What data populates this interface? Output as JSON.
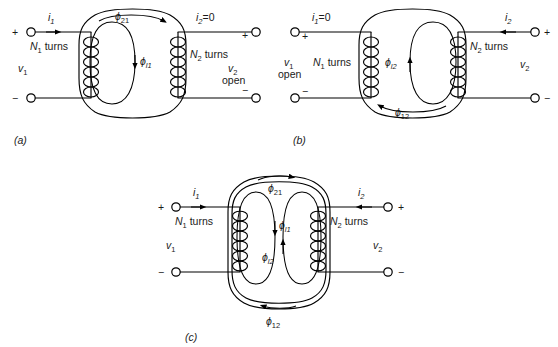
{
  "figure": {
    "type": "transformer-flux-diagram",
    "panels": [
      {
        "id": "a",
        "caption": "(a)",
        "left_terminal_top_sign": "+",
        "left_terminal_bottom_sign": "−",
        "right_terminal_top_sign": "+",
        "right_terminal_bottom_sign": "−",
        "current_left": {
          "symbol": "i",
          "subscript": "1",
          "value": "",
          "text": "i"
        },
        "current_right": {
          "symbol": "i",
          "subscript": "2",
          "value": "=0",
          "text": "i"
        },
        "voltage_left": {
          "symbol": "v",
          "subscript": "1",
          "note": ""
        },
        "voltage_right": {
          "symbol": "v",
          "subscript": "2",
          "note": "open"
        },
        "turns_left": {
          "symbol": "N",
          "subscript": "1",
          "word": "turns"
        },
        "turns_right": {
          "symbol": "N",
          "subscript": "2",
          "word": "turns"
        },
        "flux_mutual": {
          "symbol": "ϕ",
          "subscript": "21"
        },
        "flux_leakage": {
          "symbol": "ϕ",
          "subscript": "l1"
        }
      },
      {
        "id": "b",
        "caption": "(b)",
        "left_terminal_top_sign": "+",
        "left_terminal_bottom_sign": "−",
        "right_terminal_top_sign": "+",
        "right_terminal_bottom_sign": "−",
        "current_left": {
          "symbol": "i",
          "subscript": "1",
          "value": "=0",
          "text": "i"
        },
        "current_right": {
          "symbol": "i",
          "subscript": "2",
          "value": "",
          "text": "i"
        },
        "voltage_left": {
          "symbol": "v",
          "subscript": "1",
          "note": "open"
        },
        "voltage_right": {
          "symbol": "v",
          "subscript": "2",
          "note": ""
        },
        "turns_left": {
          "symbol": "N",
          "subscript": "1",
          "word": "turns"
        },
        "turns_right": {
          "symbol": "N",
          "subscript": "2",
          "word": "turns"
        },
        "flux_mutual": {
          "symbol": "ϕ",
          "subscript": "12"
        },
        "flux_leakage": {
          "symbol": "ϕ",
          "subscript": "l2"
        }
      },
      {
        "id": "c",
        "caption": "(c)",
        "left_terminal_top_sign": "+",
        "left_terminal_bottom_sign": "−",
        "right_terminal_top_sign": "+",
        "right_terminal_bottom_sign": "−",
        "current_left": {
          "symbol": "i",
          "subscript": "1",
          "value": "",
          "text": "i"
        },
        "current_right": {
          "symbol": "i",
          "subscript": "2",
          "value": "",
          "text": "i"
        },
        "voltage_left": {
          "symbol": "v",
          "subscript": "1",
          "note": ""
        },
        "voltage_right": {
          "symbol": "v",
          "subscript": "2",
          "note": ""
        },
        "turns_left": {
          "symbol": "N",
          "subscript": "1",
          "word": "turns"
        },
        "turns_right": {
          "symbol": "N",
          "subscript": "2",
          "word": "turns"
        },
        "flux_mutual_top": {
          "symbol": "ϕ",
          "subscript": "21"
        },
        "flux_mutual_bottom": {
          "symbol": "ϕ",
          "subscript": "12"
        },
        "flux_leakage_1": {
          "symbol": "ϕ",
          "subscript": "l1"
        },
        "flux_leakage_2": {
          "symbol": "ϕ",
          "subscript": "l2"
        }
      }
    ],
    "colors": {
      "ink": "#000000",
      "background": "#ffffff"
    }
  }
}
